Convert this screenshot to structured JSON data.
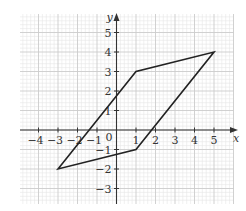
{
  "chart_data": {
    "type": "line",
    "title": "",
    "xlabel": "x",
    "ylabel": "y",
    "xlim": [
      -4.95,
      6.0
    ],
    "ylim": [
      -3.8,
      5.95
    ],
    "grid": true,
    "grid_minor_divisions": 5,
    "x_ticks": [
      -4,
      -3,
      -2,
      -1,
      1,
      2,
      3,
      4,
      5
    ],
    "y_ticks": [
      -3,
      -2,
      -1,
      1,
      2,
      3,
      4,
      5
    ],
    "x_tick_labels": [
      "−4",
      "−3",
      "−2",
      "−1",
      "1",
      "2",
      "3",
      "4",
      "5"
    ],
    "y_tick_labels": [
      "−3",
      "−2",
      "−1",
      "1",
      "2",
      "3",
      "4",
      "5"
    ],
    "origin_label": "0",
    "series": [
      {
        "name": "parallelogram",
        "closed": true,
        "points": [
          [
            -3,
            -2
          ],
          [
            1,
            3
          ],
          [
            5,
            4
          ],
          [
            1,
            -1
          ]
        ]
      }
    ],
    "colors": {
      "grid_minor": "#e6e6e6",
      "grid_major": "#cccccc",
      "axis": "#333333",
      "shape": "#222222"
    }
  }
}
